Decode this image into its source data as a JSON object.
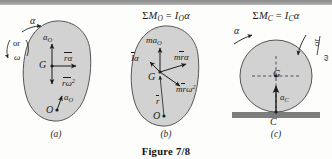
{
  "figure": {
    "caption": "Figure 7/8",
    "colors": {
      "body_fill": "#d2d2d2",
      "body_stroke": "#555555",
      "ground": "#7d7d7d",
      "scanbar": "#9a9a9a",
      "ink": "#1b1b1b"
    }
  },
  "panels": [
    {
      "id": "a",
      "subcaption": "(a)",
      "equation": null,
      "rotation_labels": {
        "alpha": "α",
        "or": "or",
        "omega": "ω"
      },
      "labels": {
        "a_O_top": "a",
        "a_O_top_sub": "O",
        "r_alpha": "rα",
        "G": "G",
        "r_omega2": "rω",
        "r_omega2_sup": "2",
        "a_O_bottom": "a",
        "a_O_bottom_sub": "O",
        "O": "O"
      }
    },
    {
      "id": "b",
      "subcaption": "(b)",
      "equation": {
        "sum": "Σ",
        "M": "M",
        "M_sub": "O",
        "eq": "=",
        "I": "I",
        "I_sub": "O",
        "alpha": "α"
      },
      "labels": {
        "ma_O": "ma",
        "ma_O_sub": "O",
        "I_alpha": "Iα",
        "mr_alpha": "mrα",
        "G": "G",
        "mr_omega2": "mrω",
        "mr_omega2_sup": "2",
        "r_bar": "r",
        "O": "O"
      }
    },
    {
      "id": "c",
      "subcaption": "(c)",
      "equation": {
        "sum": "Σ",
        "M": "M",
        "M_sub": "C",
        "eq": "=",
        "I": "I",
        "I_sub": "C",
        "alpha": "α"
      },
      "rotation_labels": {
        "alpha": "α",
        "or": "or",
        "omega": "ω"
      },
      "labels": {
        "G": "G",
        "a_C": "a",
        "a_C_sub": "C",
        "C": "C"
      }
    }
  ]
}
